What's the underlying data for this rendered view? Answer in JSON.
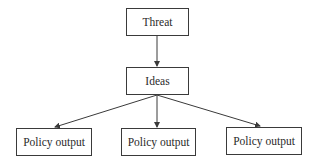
{
  "diagram": {
    "type": "flowchart",
    "nodes": [
      {
        "id": "threat",
        "label": "Threat"
      },
      {
        "id": "ideas",
        "label": "Ideas"
      },
      {
        "id": "policy1",
        "label": "Policy output"
      },
      {
        "id": "policy2",
        "label": "Policy output"
      },
      {
        "id": "policy3",
        "label": "Policy output"
      }
    ],
    "edges": [
      {
        "from": "threat",
        "to": "ideas"
      },
      {
        "from": "ideas",
        "to": "policy1"
      },
      {
        "from": "ideas",
        "to": "policy2"
      },
      {
        "from": "ideas",
        "to": "policy3"
      }
    ],
    "colors": {
      "stroke": "#3a3a3a",
      "background": "#ffffff",
      "text": "#2a2a2a"
    }
  }
}
